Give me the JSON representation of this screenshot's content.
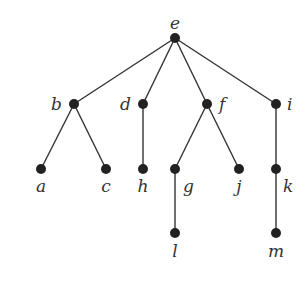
{
  "diagram": {
    "type": "rooted-tree",
    "root": "e",
    "nodes": [
      {
        "id": "e",
        "label": "e",
        "x": 175,
        "y": 38,
        "lx": 175,
        "ly": 29,
        "anchor": "middle"
      },
      {
        "id": "b",
        "label": "b",
        "x": 74,
        "y": 104,
        "lx": 62,
        "ly": 110,
        "anchor": "end"
      },
      {
        "id": "d",
        "label": "d",
        "x": 143,
        "y": 104,
        "lx": 131,
        "ly": 110,
        "anchor": "end"
      },
      {
        "id": "f",
        "label": "f",
        "x": 207,
        "y": 104,
        "lx": 219,
        "ly": 110,
        "anchor": "start"
      },
      {
        "id": "i",
        "label": "i",
        "x": 276,
        "y": 104,
        "lx": 287,
        "ly": 110,
        "anchor": "start"
      },
      {
        "id": "a",
        "label": "a",
        "x": 41,
        "y": 169,
        "lx": 41,
        "ly": 192,
        "anchor": "middle"
      },
      {
        "id": "c",
        "label": "c",
        "x": 106,
        "y": 169,
        "lx": 106,
        "ly": 192,
        "anchor": "middle"
      },
      {
        "id": "h",
        "label": "h",
        "x": 143,
        "y": 169,
        "lx": 143,
        "ly": 192,
        "anchor": "middle"
      },
      {
        "id": "g",
        "label": "g",
        "x": 175,
        "y": 169,
        "lx": 183,
        "ly": 192,
        "anchor": "start"
      },
      {
        "id": "j",
        "label": "j",
        "x": 239,
        "y": 169,
        "lx": 239,
        "ly": 192,
        "anchor": "middle"
      },
      {
        "id": "k",
        "label": "k",
        "x": 276,
        "y": 169,
        "lx": 283,
        "ly": 192,
        "anchor": "start"
      },
      {
        "id": "l",
        "label": "l",
        "x": 175,
        "y": 233,
        "lx": 175,
        "ly": 257,
        "anchor": "middle"
      },
      {
        "id": "m",
        "label": "m",
        "x": 276,
        "y": 233,
        "lx": 276,
        "ly": 257,
        "anchor": "middle"
      }
    ],
    "edges": [
      [
        "e",
        "b"
      ],
      [
        "e",
        "d"
      ],
      [
        "e",
        "f"
      ],
      [
        "e",
        "i"
      ],
      [
        "b",
        "a"
      ],
      [
        "b",
        "c"
      ],
      [
        "d",
        "h"
      ],
      [
        "f",
        "g"
      ],
      [
        "f",
        "j"
      ],
      [
        "i",
        "k"
      ],
      [
        "g",
        "l"
      ],
      [
        "k",
        "m"
      ]
    ]
  }
}
